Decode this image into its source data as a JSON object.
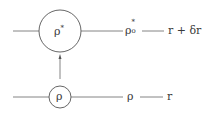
{
  "diagram": {
    "top_node": {
      "label": "ρ",
      "superscript": "*"
    },
    "bottom_node": {
      "label": "ρ"
    },
    "top_output": {
      "label": "ρ",
      "superscript": "*",
      "subscript": "o"
    },
    "top_result": "r + δr",
    "bottom_output": {
      "label": "ρ"
    },
    "bottom_result": "r",
    "colors": {
      "stroke": "#555555",
      "text": "#3a3a3a"
    }
  }
}
